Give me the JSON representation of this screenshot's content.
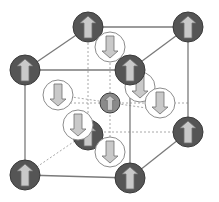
{
  "diagram": {
    "colors": {
      "background": "#ffffff",
      "edge": "#7a7a7a",
      "hidden_edge": "#a8a8a8",
      "dark_sphere": "#555555",
      "dark_sphere_stroke": "#3a3a3a",
      "center_sphere": "#8a8a8a",
      "white_sphere": "#ffffff",
      "white_sphere_stroke": "#8c8c8c",
      "arrow_fill": "#c9c9c9",
      "arrow_stroke": "#6e6e6e"
    },
    "cube_vertices": {
      "back_top_left": [
        88,
        27
      ],
      "back_top_right": [
        188,
        27
      ],
      "back_bottom_left": [
        88,
        132
      ],
      "back_bottom_right": [
        188,
        132
      ],
      "front_top_left": [
        25,
        70
      ],
      "front_top_right": [
        130,
        70
      ],
      "front_bottom_left": [
        25,
        175
      ],
      "front_bottom_right": [
        130,
        178
      ]
    },
    "solid_edges": [
      [
        "back_top_left",
        "back_top_right"
      ],
      [
        "back_top_right",
        "back_bottom_right"
      ],
      [
        "front_top_left",
        "front_top_right"
      ],
      [
        "front_top_right",
        "front_bottom_right"
      ],
      [
        "front_bottom_left",
        "front_bottom_right"
      ],
      [
        "front_top_left",
        "front_bottom_left"
      ],
      [
        "front_top_left",
        "back_top_left"
      ],
      [
        "front_top_right",
        "back_top_right"
      ],
      [
        "front_bottom_right",
        "back_bottom_right"
      ]
    ],
    "hidden_edges": [
      [
        "back_top_left",
        "back_bottom_left"
      ],
      [
        "back_bottom_left",
        "back_bottom_right"
      ],
      [
        "back_bottom_left",
        "front_bottom_left"
      ]
    ],
    "dashed_guides": [
      [
        [
          110,
          47
        ],
        [
          110,
          152
        ]
      ],
      [
        [
          58,
          103
        ],
        [
          188,
          103
        ]
      ],
      [
        [
          58,
          95
        ],
        [
          160,
          110
        ]
      ]
    ],
    "atoms": [
      {
        "id": "back-bottom-left",
        "x": 88,
        "y": 135,
        "r": 15,
        "type": "dark",
        "spin": "up",
        "layer": 1
      },
      {
        "id": "back-top-left",
        "x": 88,
        "y": 27,
        "r": 15,
        "type": "dark",
        "spin": "up",
        "layer": 2
      },
      {
        "id": "back-top-right",
        "x": 188,
        "y": 27,
        "r": 15,
        "type": "dark",
        "spin": "up",
        "layer": 2
      },
      {
        "id": "back-bottom-right",
        "x": 188,
        "y": 132,
        "r": 15,
        "type": "dark",
        "spin": "up",
        "layer": 2
      },
      {
        "id": "face-top",
        "x": 110,
        "y": 47,
        "r": 15,
        "type": "white",
        "spin": "down",
        "layer": 3
      },
      {
        "id": "face-back-right",
        "x": 140,
        "y": 87,
        "r": 15,
        "type": "white",
        "spin": "down",
        "layer": 3
      },
      {
        "id": "body-center",
        "x": 110,
        "y": 103,
        "r": 10,
        "type": "center",
        "spin": "up",
        "layer": 3
      },
      {
        "id": "face-left",
        "x": 58,
        "y": 95,
        "r": 15,
        "type": "white",
        "spin": "down",
        "layer": 4
      },
      {
        "id": "face-right",
        "x": 160,
        "y": 103,
        "r": 15,
        "type": "white",
        "spin": "down",
        "layer": 4
      },
      {
        "id": "face-bottom",
        "x": 110,
        "y": 152,
        "r": 15,
        "type": "white",
        "spin": "down",
        "layer": 4
      },
      {
        "id": "face-front",
        "x": 78,
        "y": 125,
        "r": 15,
        "type": "white",
        "spin": "down",
        "layer": 5
      },
      {
        "id": "front-top-left",
        "x": 25,
        "y": 70,
        "r": 15,
        "type": "dark",
        "spin": "up",
        "layer": 6
      },
      {
        "id": "front-top-right",
        "x": 130,
        "y": 70,
        "r": 15,
        "type": "dark",
        "spin": "up",
        "layer": 6
      },
      {
        "id": "front-bottom-left",
        "x": 25,
        "y": 175,
        "r": 15,
        "type": "dark",
        "spin": "up",
        "layer": 6
      },
      {
        "id": "front-bottom-right",
        "x": 130,
        "y": 178,
        "r": 15,
        "type": "dark",
        "spin": "up",
        "layer": 6
      }
    ]
  }
}
